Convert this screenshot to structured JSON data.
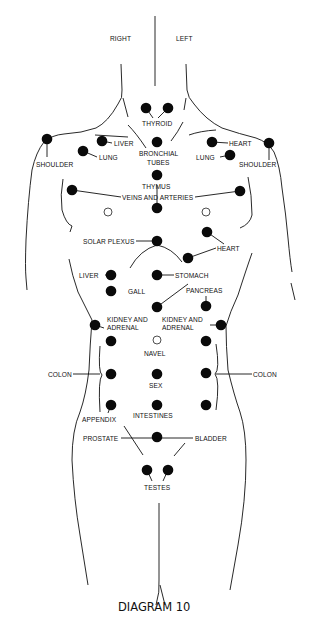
{
  "header": {
    "right_label": "RIGHT",
    "left_label": "LEFT"
  },
  "labels": {
    "thyroid": "THYROID",
    "bronchial_1": "BRONCHIAL",
    "bronchial_2": "TUBES",
    "liver_upper": "LIVER",
    "lung_right_side": "LUNG",
    "shoulder_right_side": "SHOULDER",
    "heart_upper": "HEART",
    "lung_left_side": "LUNG",
    "shoulder_left_side": "SHOULDER",
    "thymus": "THYMUS",
    "veins": "VEINS AND ARTERIES",
    "solar_plexus": "SOLAR PLEXUS",
    "heart_lower": "HEART",
    "liver_mid": "LIVER",
    "stomach": "STOMACH",
    "gall": "GALL",
    "pancreas": "PANCREAS",
    "kidney_right_side_1": "KIDNEY AND",
    "kidney_right_side_2": "ADRENAL",
    "kidney_left_side_1": "KIDNEY AND",
    "kidney_left_side_2": "ADRENAL",
    "navel": "NAVEL",
    "colon_right_side": "COLON",
    "colon_left_side": "COLON",
    "sex": "SEX",
    "appendix": "APPENDIX",
    "intestines": "INTESTINES",
    "prostate": "PROSTATE",
    "bladder": "BLADDER",
    "testes": "TESTES"
  },
  "caption": "DIAGRAM 10",
  "points": {
    "filled_count": 40,
    "open_count": 3,
    "fill_color": "#0a0a0a",
    "line_color": "#111111"
  }
}
